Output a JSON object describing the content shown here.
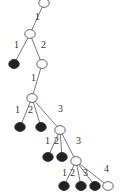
{
  "diagram": {
    "type": "rooted tree",
    "colors": {
      "edge": "#6a6a6a",
      "filled_node": "#222222",
      "open_node": "#ffffff"
    },
    "nodes": [
      {
        "id": "n1",
        "x": 44,
        "y": 3,
        "filled": false
      },
      {
        "id": "n2",
        "x": 30,
        "y": 34,
        "filled": false
      },
      {
        "id": "l1",
        "x": 14,
        "y": 64,
        "filled": true
      },
      {
        "id": "n3",
        "x": 42,
        "y": 64,
        "filled": false
      },
      {
        "id": "n4",
        "x": 32,
        "y": 98,
        "filled": false
      },
      {
        "id": "l2",
        "x": 20,
        "y": 127,
        "filled": true
      },
      {
        "id": "l3",
        "x": 41,
        "y": 127,
        "filled": true
      },
      {
        "id": "n5",
        "x": 60,
        "y": 130,
        "filled": false
      },
      {
        "id": "l4",
        "x": 48,
        "y": 157,
        "filled": true
      },
      {
        "id": "l5",
        "x": 62,
        "y": 157,
        "filled": true
      },
      {
        "id": "n6",
        "x": 76,
        "y": 161,
        "filled": false
      },
      {
        "id": "l6",
        "x": 64,
        "y": 186,
        "filled": true
      },
      {
        "id": "l7",
        "x": 81,
        "y": 186,
        "filled": true
      },
      {
        "id": "l8",
        "x": 95,
        "y": 186,
        "filled": true
      },
      {
        "id": "l9",
        "x": 108,
        "y": 186,
        "filled": false
      }
    ],
    "edges": [
      {
        "from": "n1",
        "to": "n2",
        "label": "1",
        "lx": 35,
        "ly": 20
      },
      {
        "from": "n2",
        "to": "l1",
        "label": "1",
        "lx": 14,
        "ly": 48
      },
      {
        "from": "n2",
        "to": "n3",
        "label": "2",
        "lx": 41,
        "ly": 48
      },
      {
        "from": "n3",
        "to": "n4",
        "label": "1",
        "lx": 31,
        "ly": 81
      },
      {
        "from": "n4",
        "to": "l2",
        "label": "1",
        "lx": 15,
        "ly": 113
      },
      {
        "from": "n4",
        "to": "l3",
        "label": "2",
        "lx": 28,
        "ly": 113
      },
      {
        "from": "n4",
        "to": "n5",
        "label": "3",
        "lx": 58,
        "ly": 112
      },
      {
        "from": "n5",
        "to": "l4",
        "label": "1",
        "lx": 45,
        "ly": 144
      },
      {
        "from": "n5",
        "to": "l5",
        "label": "2",
        "lx": 54,
        "ly": 144
      },
      {
        "from": "n5",
        "to": "n6",
        "label": "3",
        "lx": 76,
        "ly": 144
      },
      {
        "from": "n6",
        "to": "l6",
        "label": "1",
        "lx": 62,
        "ly": 176
      },
      {
        "from": "n6",
        "to": "l7",
        "label": "2",
        "lx": 70,
        "ly": 176
      },
      {
        "from": "n6",
        "to": "l8",
        "label": "3",
        "lx": 83,
        "ly": 176
      },
      {
        "from": "n6",
        "to": "l9",
        "label": "4",
        "lx": 104,
        "ly": 172
      }
    ]
  }
}
